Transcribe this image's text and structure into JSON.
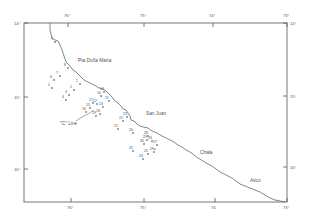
{
  "map": {
    "frame": {
      "left": 24,
      "top": 23,
      "right": 287,
      "bottom": 202
    },
    "colors": {
      "line": "#555555",
      "coast": "#666666",
      "text": "#555555",
      "background": "#ffffff"
    },
    "longitude_ticks_top": [
      {
        "label": "76°",
        "x": 68
      },
      {
        "label": "75°",
        "x": 144
      },
      {
        "label": "74°",
        "x": 213
      },
      {
        "label": "73°",
        "x": 287
      }
    ],
    "longitude_ticks_bottom": [
      {
        "label": "76°",
        "x": 71
      },
      {
        "label": "75°",
        "x": 144
      },
      {
        "label": "74",
        "x": 215
      },
      {
        "label": "73°",
        "x": 287
      }
    ],
    "latitude_ticks_left": [
      {
        "label": "14°",
        "y": 23
      },
      {
        "label": "15°",
        "y": 97
      },
      {
        "label": "16°",
        "y": 169
      }
    ],
    "latitude_ticks_right": [
      {
        "label": "14°",
        "y": 23
      },
      {
        "label": "15°",
        "y": 96
      },
      {
        "label": "16°",
        "y": 167
      }
    ],
    "places": [
      {
        "name": "Pta Doña Maria",
        "x": 78,
        "y": 62
      },
      {
        "name": "San Juan",
        "x": 146,
        "y": 115
      },
      {
        "name": "Chala",
        "x": 200,
        "y": 154
      },
      {
        "name": "Atico",
        "x": 250,
        "y": 182
      }
    ],
    "line_label": {
      "text": "\"C\" Line",
      "x": 60,
      "y": 125
    },
    "stations": [
      {
        "id": "1",
        "x": 78,
        "y": 82
      },
      {
        "id": "2",
        "x": 72,
        "y": 88
      },
      {
        "id": "3",
        "x": 67,
        "y": 93
      },
      {
        "id": "4",
        "x": 64,
        "y": 98
      },
      {
        "id": "5",
        "x": 50,
        "y": 86
      },
      {
        "id": "6",
        "x": 52,
        "y": 78
      },
      {
        "id": "7",
        "x": 58,
        "y": 74
      },
      {
        "id": "8",
        "x": 66,
        "y": 66
      },
      {
        "id": "9",
        "x": 53,
        "y": 40
      },
      {
        "id": "10",
        "x": 99,
        "y": 94
      },
      {
        "id": "11",
        "x": 107,
        "y": 99
      },
      {
        "id": "12",
        "x": 95,
        "y": 102
      },
      {
        "id": "13",
        "x": 101,
        "y": 105
      },
      {
        "id": "14",
        "x": 102,
        "y": 90
      },
      {
        "id": "15",
        "x": 88,
        "y": 106
      },
      {
        "id": "16",
        "x": 84,
        "y": 110
      },
      {
        "id": "17",
        "x": 91,
        "y": 101
      },
      {
        "id": "18",
        "x": 98,
        "y": 112
      },
      {
        "id": "19",
        "x": 94,
        "y": 114
      },
      {
        "id": "20",
        "x": 131,
        "y": 131
      },
      {
        "id": "21",
        "x": 116,
        "y": 127
      },
      {
        "id": "22",
        "x": 121,
        "y": 119
      },
      {
        "id": "23",
        "x": 125,
        "y": 115
      },
      {
        "id": "24",
        "x": 141,
        "y": 157
      },
      {
        "id": "25",
        "x": 146,
        "y": 152
      },
      {
        "id": "26",
        "x": 150,
        "y": 139
      },
      {
        "id": "27",
        "x": 155,
        "y": 143
      },
      {
        "id": "28",
        "x": 146,
        "y": 134
      },
      {
        "id": "29",
        "x": 145,
        "y": 138
      },
      {
        "id": "30",
        "x": 142,
        "y": 142
      },
      {
        "id": "31",
        "x": 131,
        "y": 149
      },
      {
        "id": "29a",
        "x": 152,
        "y": 150
      }
    ],
    "coastline": "M50,23 L50,30 L51,34 L52,38 L55,40 L58,41 L60,45 L62,50 L64,56 L66,62 L70,66 L73,70 L76,72 L80,76 L84,80 L88,82 L92,84 L96,86 L99,88 L103,89 L106,91 L109,94 L112,97 L114,100 L118,103 L121,106 L123,109 L126,110 L128,113 L130,116 L131,120 L134,121 L137,124 L140,126 L143,127 L148,128 L152,131 L157,133 L162,136 L166,138 L170,140 L174,142 L178,145 L182,147 L186,150 L190,152 L194,155 L198,158 L203,161 L208,164 L212,166 L216,169 L220,172 L224,174 L228,176 L232,178 L236,181 L240,184 L245,186 L250,188 L255,190 L260,192 L265,195 L270,198 L275,200 L280,201 L285,202",
    "c_line": "M76,121 L82,117 L88,114 L94,110"
  }
}
